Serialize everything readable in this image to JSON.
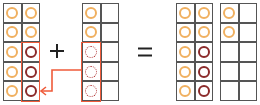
{
  "colors": {
    "yellow_counter": "#f0b060",
    "red_counter": "#8b2a2a",
    "highlight": "#ef5b3a",
    "grid": "#555555"
  },
  "operators": {
    "plus": "+",
    "equals": "="
  },
  "frames": [
    {
      "id": "addend-1",
      "left": 3,
      "cells": [
        "Y",
        "Y",
        "Y",
        "Y",
        "Y",
        "R",
        "Y",
        "R",
        "Y",
        "R"
      ]
    },
    {
      "id": "addend-2",
      "left": 82,
      "cells": [
        "Y",
        "",
        "Y",
        "",
        "D",
        "",
        "D",
        "",
        "D",
        ""
      ]
    },
    {
      "id": "sum-frame-1",
      "left": 176,
      "cells": [
        "Y",
        "Y",
        "Y",
        "Y",
        "Y",
        "R",
        "Y",
        "R",
        "Y",
        "R"
      ]
    },
    {
      "id": "sum-frame-2",
      "left": 220,
      "cells": [
        "Y",
        "",
        "Y",
        "",
        "",
        "",
        "",
        "",
        "",
        ""
      ]
    }
  ],
  "legend": {
    "Y": "yellow counter",
    "R": "moved counter (red)",
    "D": "counter to move (dotted)"
  }
}
